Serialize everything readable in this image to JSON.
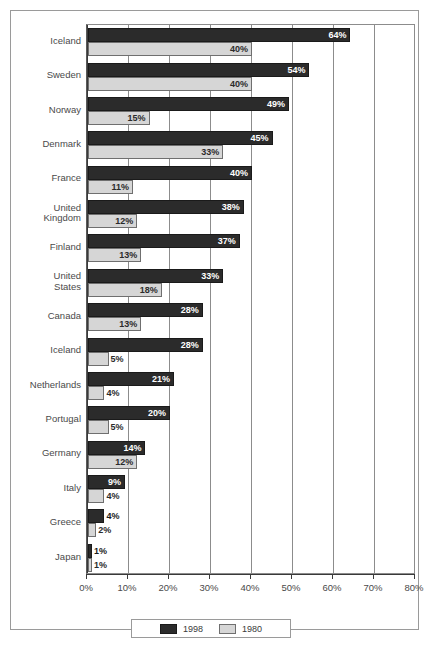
{
  "chart_data": {
    "type": "bar",
    "orientation": "horizontal",
    "title": "",
    "subtitle": "",
    "xlabel": "",
    "ylabel": "",
    "xlim": [
      0,
      80
    ],
    "xtick_labels": [
      "0%",
      "10%",
      "20%",
      "30%",
      "40%",
      "50%",
      "60%",
      "70%",
      "80%"
    ],
    "xtick_values": [
      0,
      10,
      20,
      30,
      40,
      50,
      60,
      70,
      80
    ],
    "grid": "vertical",
    "legend_position": "bottom-center",
    "value_suffix": "%",
    "categories": [
      "Iceland",
      "Sweden",
      "Norway",
      "Denmark",
      "France",
      "United\nKingdom",
      "Finland",
      "United\nStates",
      "Canada",
      "Iceland",
      "Netherlands",
      "Portugal",
      "Germany",
      "Italy",
      "Greece",
      "Japan"
    ],
    "series": [
      {
        "name": "1998",
        "color": "#2b2b2b",
        "values": [
          64,
          54,
          49,
          45,
          40,
          38,
          37,
          33,
          28,
          28,
          21,
          20,
          14,
          9,
          4,
          1
        ],
        "labels": [
          "64%",
          "54%",
          "49%",
          "45%",
          "40%",
          "38%",
          "37%",
          "33%",
          "28%",
          "28%",
          "21%",
          "20%",
          "14%",
          "9%",
          "4%",
          "1%"
        ]
      },
      {
        "name": "1980",
        "color": "#d6d6d6",
        "values": [
          40,
          40,
          15,
          33,
          11,
          12,
          13,
          18,
          13,
          5,
          4,
          5,
          12,
          4,
          2,
          1
        ],
        "labels": [
          "40%",
          "40%",
          "15%",
          "33%",
          "11%",
          "12%",
          "13%",
          "18%",
          "13%",
          "5%",
          "4%",
          "5%",
          "12%",
          "4%",
          "2%",
          "1%"
        ]
      }
    ]
  },
  "legend": {
    "items": [
      {
        "label": "1998",
        "swatch": "dark-swatch"
      },
      {
        "label": "1980",
        "swatch": "light-swatch"
      }
    ]
  }
}
